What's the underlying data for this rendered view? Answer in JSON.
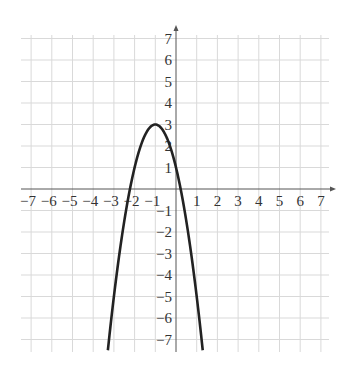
{
  "chart_data": {
    "type": "line",
    "title": "",
    "xlabel": "",
    "ylabel": "",
    "xlim": [
      -7.5,
      7.5
    ],
    "ylim": [
      -7.5,
      7.5
    ],
    "grid": true,
    "x_ticks": [
      -7,
      -6,
      -5,
      -4,
      -3,
      -2,
      -1,
      1,
      2,
      3,
      4,
      5,
      6,
      7
    ],
    "y_ticks": [
      7,
      6,
      5,
      4,
      3,
      2,
      1,
      -1,
      -2,
      -3,
      -4,
      -5,
      -6,
      -7
    ],
    "x_tick_labels": [
      "−7",
      "−6",
      "−5",
      "−4",
      "−3",
      "−2",
      "−1",
      "1",
      "2",
      "3",
      "4",
      "5",
      "6",
      "7"
    ],
    "y_tick_labels": [
      "7",
      "6",
      "5",
      "4",
      "3",
      "2",
      "1",
      "−1",
      "−2",
      "−3",
      "−4",
      "−5",
      "−6",
      "−7"
    ],
    "series": [
      {
        "name": "parabola",
        "equation": "y = -2(x+1)^2 + 3",
        "coefficients": {
          "a": -2,
          "b": -4,
          "c": 1
        },
        "vertex": [
          -1,
          3
        ],
        "x_intercepts": [
          -2.22,
          0.22
        ],
        "y_intercept": 1,
        "color": "#222222"
      }
    ]
  }
}
